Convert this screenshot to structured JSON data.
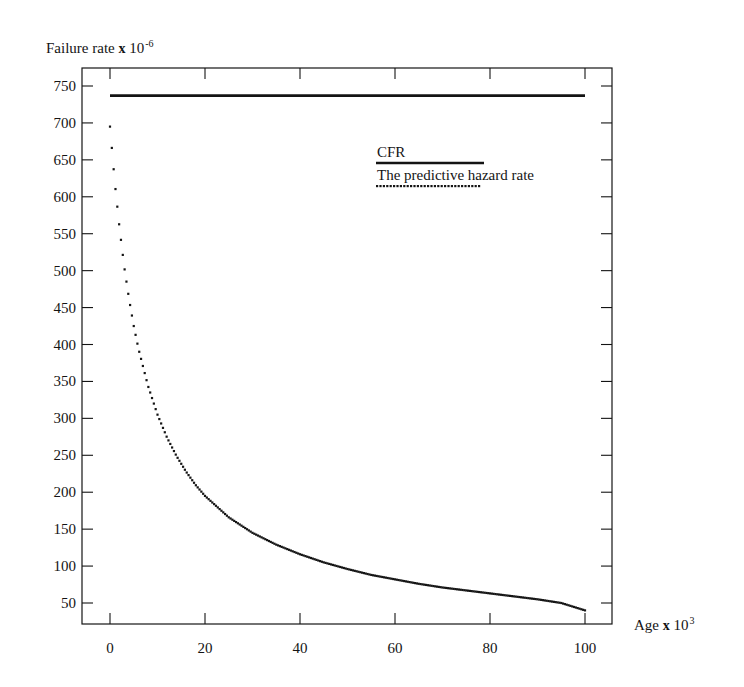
{
  "figure": {
    "background": "#ffffff",
    "ink_color": "#141414"
  },
  "axes": {
    "y": {
      "title_prefix": "Failure rate",
      "title_mult": "x",
      "title_base": "10",
      "title_exponent": "-6",
      "ticks": [
        50,
        100,
        150,
        200,
        250,
        300,
        350,
        400,
        450,
        500,
        550,
        600,
        650,
        700,
        750
      ],
      "range": [
        0,
        775
      ]
    },
    "x": {
      "title_prefix": "Age",
      "title_mult": "x",
      "title_base": "10",
      "title_exponent": "3",
      "ticks": [
        0,
        20,
        40,
        60,
        80,
        100
      ],
      "range": [
        -2.5,
        105.5
      ]
    }
  },
  "legend": {
    "position": "inside-upper-right",
    "entries": [
      {
        "label": "CFR",
        "style": "solid",
        "color": "#141414"
      },
      {
        "label": "The predictive hazard rate",
        "style": "dotted",
        "color": "#141414"
      }
    ]
  },
  "chart_data": {
    "type": "line",
    "title": "",
    "xlabel": "Age x 10^3",
    "ylabel": "Failure rate x 10^-6",
    "xlim": [
      -2.5,
      105.5
    ],
    "ylim": [
      0,
      775
    ],
    "grid": false,
    "legend_position": "inside-upper-right",
    "series": [
      {
        "name": "CFR",
        "style": "solid",
        "color": "#141414",
        "x": [
          0,
          100
        ],
        "values": [
          737,
          737
        ]
      },
      {
        "name": "The predictive hazard rate",
        "style": "dotted",
        "color": "#141414",
        "x": [
          0,
          1,
          2,
          3,
          4,
          5,
          6,
          8,
          10,
          12,
          14,
          16,
          18,
          20,
          25,
          30,
          35,
          40,
          45,
          50,
          55,
          60,
          65,
          70,
          75,
          80,
          85,
          90,
          95,
          100
        ],
        "values": [
          695,
          620,
          558,
          505,
          462,
          425,
          394,
          344,
          305,
          274,
          249,
          228,
          210,
          195,
          166,
          145,
          129,
          116,
          105,
          96,
          88,
          82,
          76,
          71,
          67,
          63,
          59,
          55,
          50,
          40
        ]
      }
    ]
  }
}
